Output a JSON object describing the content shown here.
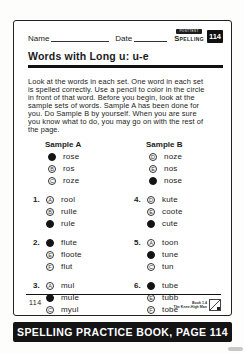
{
  "page": {
    "header": {
      "name_label": "Name",
      "date_label": "Date",
      "corner_tag": "POSTTEST",
      "subject_label": "Spelling",
      "page_badge": "114"
    },
    "title": "Words with Long u: u-e",
    "instructions": "Look at the words in each set. One word in each set is spelled correctly. Use a pencil to color in the circle in front of that word. Before you begin, look at the sample sets of words. Sample A has been done for you. Do Sample B by yourself. When you are sure you know what to do, you may go on with the rest of the page.",
    "samples": [
      {
        "label": "Sample A",
        "options": [
          {
            "letter": "A",
            "word": "rose",
            "filled": true
          },
          {
            "letter": "B",
            "word": "ros",
            "filled": false
          },
          {
            "letter": "C",
            "word": "roze",
            "filled": false
          }
        ]
      },
      {
        "label": "Sample B",
        "options": [
          {
            "letter": "D",
            "word": "noze",
            "filled": false
          },
          {
            "letter": "E",
            "word": "nos",
            "filled": false
          },
          {
            "letter": "F",
            "word": "nose",
            "filled": true
          }
        ]
      }
    ],
    "items": [
      {
        "number": "1.",
        "options": [
          {
            "letter": "A",
            "word": "rool",
            "filled": false
          },
          {
            "letter": "B",
            "word": "rulle",
            "filled": false
          },
          {
            "letter": "C",
            "word": "rule",
            "filled": true
          }
        ]
      },
      {
        "number": "4.",
        "options": [
          {
            "letter": "D",
            "word": "kute",
            "filled": false
          },
          {
            "letter": "E",
            "word": "coote",
            "filled": false
          },
          {
            "letter": "F",
            "word": "cute",
            "filled": true
          }
        ]
      },
      {
        "number": "2.",
        "options": [
          {
            "letter": "D",
            "word": "flute",
            "filled": true
          },
          {
            "letter": "E",
            "word": "floote",
            "filled": false
          },
          {
            "letter": "F",
            "word": "flut",
            "filled": false
          }
        ]
      },
      {
        "number": "5.",
        "options": [
          {
            "letter": "A",
            "word": "toon",
            "filled": false
          },
          {
            "letter": "B",
            "word": "tune",
            "filled": true
          },
          {
            "letter": "C",
            "word": "tun",
            "filled": false
          }
        ]
      },
      {
        "number": "3.",
        "options": [
          {
            "letter": "A",
            "word": "mul",
            "filled": false
          },
          {
            "letter": "B",
            "word": "mule",
            "filled": true
          },
          {
            "letter": "C",
            "word": "myul",
            "filled": false
          }
        ]
      },
      {
        "number": "6.",
        "options": [
          {
            "letter": "D",
            "word": "tube",
            "filled": true
          },
          {
            "letter": "E",
            "word": "tubb",
            "filled": false
          },
          {
            "letter": "F",
            "word": "tobe",
            "filled": false
          }
        ]
      }
    ],
    "footer": {
      "page_number": "114",
      "book_ref_line1": "Book 1.4",
      "book_ref_line2": "The Knee-High Man",
      "banner": "SPELLING PRACTICE BOOK, PAGE 114"
    }
  }
}
